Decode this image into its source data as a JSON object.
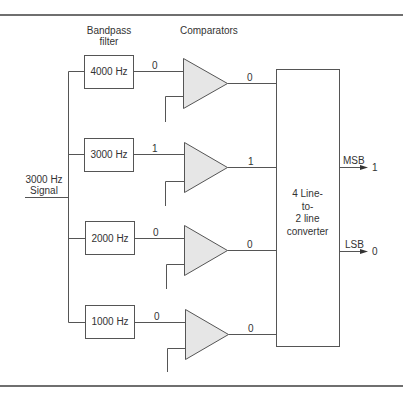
{
  "headers": {
    "filter_line1": "Bandpass",
    "filter_line2": "filter",
    "comparators": "Comparators"
  },
  "input": {
    "line1": "3000 Hz",
    "line2": "Signal"
  },
  "channels": [
    {
      "filter_label": "4000 Hz",
      "filter_output": "0",
      "comparator_output": "0"
    },
    {
      "filter_label": "3000 Hz",
      "filter_output": "1",
      "comparator_output": "1"
    },
    {
      "filter_label": "2000 Hz",
      "filter_output": "0",
      "comparator_output": "0"
    },
    {
      "filter_label": "1000 Hz",
      "filter_output": "0",
      "comparator_output": "0"
    }
  ],
  "converter": {
    "line1": "4 Line-",
    "line2": "to-",
    "line3": "2 line",
    "line4": "converter"
  },
  "outputs": {
    "msb_label": "MSB",
    "msb_value": "1",
    "lsb_label": "LSB",
    "lsb_value": "0"
  },
  "colors": {
    "line": "#555555",
    "comparator_fill": "#e6e6e6",
    "rule": "#6f6f6f"
  }
}
